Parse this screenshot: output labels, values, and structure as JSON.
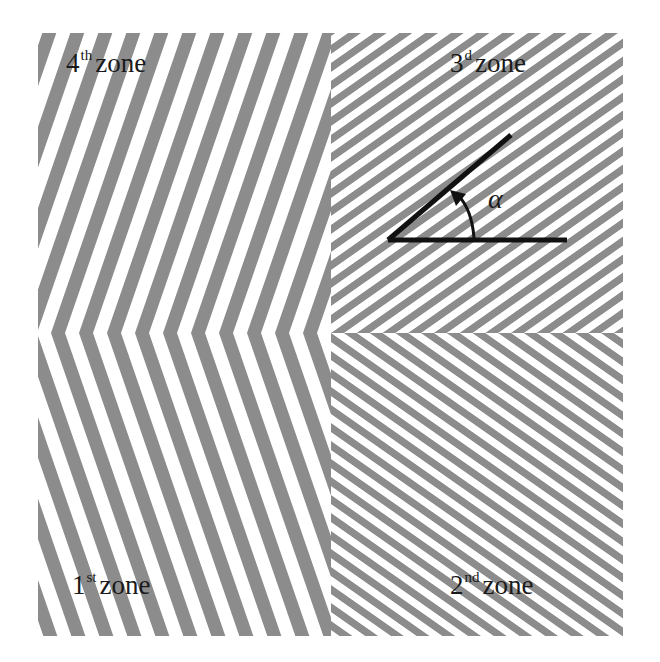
{
  "figure": {
    "stripe_color": "#8c8c8c",
    "background_color": "#ffffff",
    "annotation_color": "#111111",
    "zones": [
      {
        "id": "zone1",
        "number": "1",
        "suffix": "st",
        "word": "zone",
        "position": "bottom-left",
        "stripe_angle_deg": 109
      },
      {
        "id": "zone2",
        "number": "2",
        "suffix": "nd",
        "word": "zone",
        "position": "bottom-right",
        "stripe_angle_deg": 145
      },
      {
        "id": "zone3",
        "number": "3",
        "suffix": "d",
        "word": "zone",
        "position": "top-right",
        "stripe_angle_deg": 35
      },
      {
        "id": "zone4",
        "number": "4",
        "suffix": "th",
        "word": "zone",
        "position": "top-left",
        "stripe_angle_deg": 71
      }
    ],
    "angle_symbol": "α"
  }
}
